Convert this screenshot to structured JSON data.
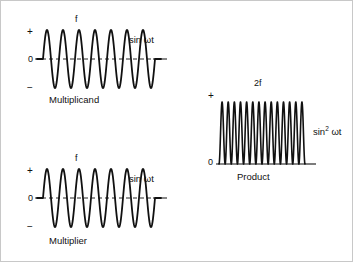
{
  "figure": {
    "background_color": "#ffffff",
    "stroke_color": "#111111",
    "border_color": "#c8c8c8"
  },
  "chart_data": {
    "type": "line",
    "title": "",
    "panels": [
      {
        "id": "multiplicand",
        "caption": "Multiplicand",
        "frequency_label": "f",
        "signal_label": "sin ωt",
        "signal_label_math": "sin wt",
        "waveform": "sine",
        "cycles": 7,
        "amplitude": 1,
        "offset": 0,
        "bipolar": true,
        "axis_labels": {
          "positive": "+",
          "zero": "0",
          "negative": "−"
        },
        "ylim": [
          -1,
          1
        ],
        "x": [
          0,
          7
        ],
        "xlabel": "",
        "ylabel": "",
        "grid": false
      },
      {
        "id": "multiplier",
        "caption": "Multiplier",
        "frequency_label": "f",
        "signal_label": "sin ωt",
        "signal_label_math": "sin wt",
        "waveform": "sine",
        "cycles": 7,
        "amplitude": 1,
        "offset": 0,
        "bipolar": true,
        "axis_labels": {
          "positive": "+",
          "zero": "0",
          "negative": "−"
        },
        "ylim": [
          -1,
          1
        ],
        "x": [
          0,
          7
        ],
        "xlabel": "",
        "ylabel": "",
        "grid": false
      },
      {
        "id": "product",
        "caption": "Product",
        "frequency_label": "2f",
        "signal_label_prefix": "sin",
        "signal_label_exponent": "2",
        "signal_label_suffix": "ωt",
        "signal_label": "sin² ωt",
        "waveform": "sine-squared",
        "cycles": 14,
        "amplitude": 1,
        "offset": 0,
        "bipolar": false,
        "axis_labels": {
          "positive": "+",
          "zero": "0"
        },
        "ylim": [
          0,
          1
        ],
        "x": [
          0,
          14
        ],
        "xlabel": "",
        "ylabel": "",
        "grid": false
      }
    ]
  }
}
